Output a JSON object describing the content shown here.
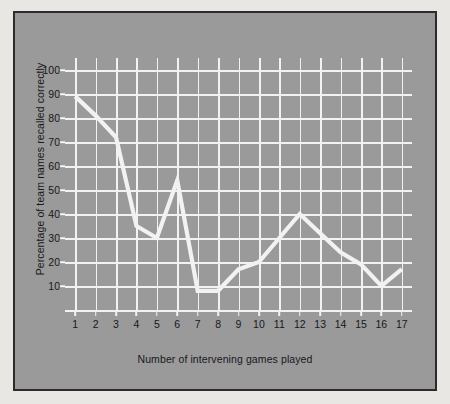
{
  "chart_data": {
    "type": "line",
    "title": "",
    "xlabel": "Number of intervening games played",
    "ylabel": "Percentage of team names recalled correctly",
    "x": [
      1,
      2,
      3,
      4,
      5,
      6,
      7,
      8,
      9,
      10,
      11,
      12,
      13,
      14,
      15,
      16,
      17
    ],
    "values": [
      89,
      81,
      72,
      35,
      30,
      54,
      8,
      8,
      17,
      20,
      30,
      40,
      32,
      24,
      19,
      10,
      17
    ],
    "series": [
      {
        "name": "Percentage of team names recalled correctly",
        "values": [
          89,
          81,
          72,
          35,
          30,
          54,
          8,
          8,
          17,
          20,
          30,
          40,
          32,
          24,
          19,
          10,
          17
        ]
      }
    ],
    "xtick_labels": [
      "1",
      "2",
      "3",
      "4",
      "5",
      "6",
      "7",
      "8",
      "9",
      "10",
      "11",
      "12",
      "13",
      "14",
      "15",
      "16",
      "17"
    ],
    "ytick_labels": [
      "10",
      "20",
      "30",
      "40",
      "50",
      "60",
      "70",
      "80",
      "90",
      "100"
    ],
    "ytick_values": [
      10,
      20,
      30,
      40,
      50,
      60,
      70,
      80,
      90,
      100
    ],
    "xlim": [
      0.5,
      17.5
    ],
    "ylim": [
      0,
      105
    ],
    "grid": true,
    "legend": "none",
    "line_color": "#f2f2f2",
    "grid_color": "#f2f2f2",
    "background_color": "#9a9a9a",
    "border_color": "#2c2c2c",
    "page_color": "#e8e7e3",
    "text_color": "#18181a"
  }
}
